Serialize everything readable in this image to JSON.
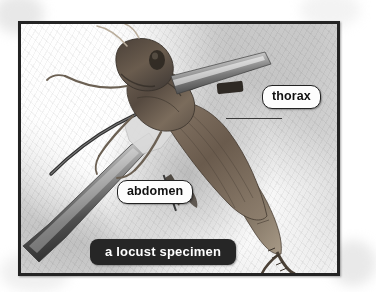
{
  "figure": {
    "caption": "a locust specimen",
    "frame_color": "#232323",
    "background_color": "#ffffff"
  },
  "callouts": [
    {
      "id": "thorax",
      "label": "thorax",
      "box_fill": "#fdfdfd",
      "box_border": "#222222",
      "text_color": "#111111",
      "leader": "horizontal line from label to upper body segment"
    },
    {
      "id": "abdomen",
      "label": "abdomen",
      "box_fill": "#fdfdfd",
      "box_border": "#222222",
      "text_color": "#111111",
      "leader": "diagonal line from label up-right to lower body segment"
    }
  ],
  "caption_bar": {
    "text": "a locust specimen",
    "background": "#262626",
    "text_color": "#ffffff"
  },
  "photo_elements": [
    {
      "name": "locust-specimen",
      "description": "dried brown locust seen from above, head upper-left, abdomen and hind leg lower-right"
    },
    {
      "name": "forceps",
      "description": "metal forceps / tweezers entering from lower-left holding the specimen"
    },
    {
      "name": "background-surface",
      "description": "mottled light grey and white surface"
    }
  ]
}
